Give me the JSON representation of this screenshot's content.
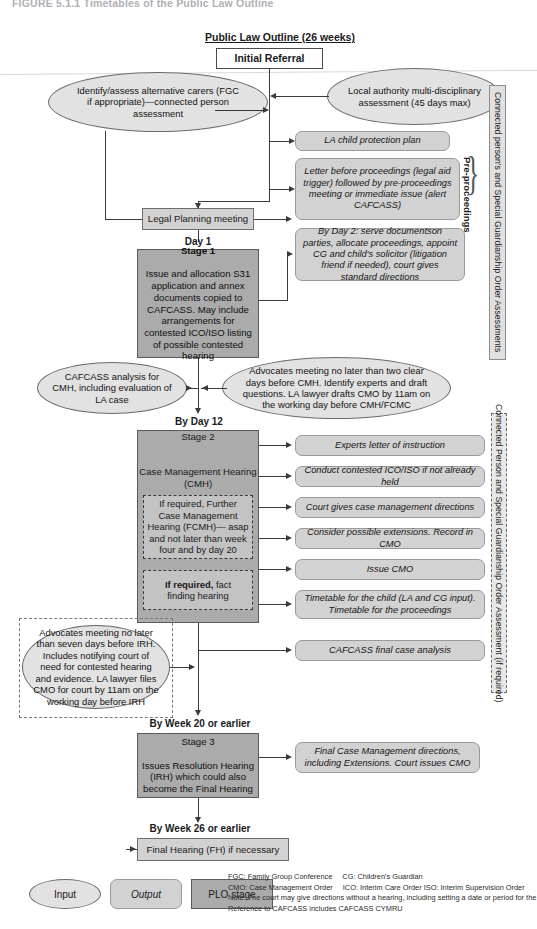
{
  "figure": {
    "caption": "FIGURE 5.1.1   Timetables of the Public Law Outline"
  },
  "header": {
    "plo_title": "Public Law Outline (26 weeks)",
    "initial_referral": "Initial Referral"
  },
  "inputs": {
    "identify_carers": "Identify/assess alternative carers (FGC if appropriate)—connected person assessment",
    "local_authority": "Local authority multi-disciplinary assessment (45 days max)",
    "cafcass_analysis": "CAFCASS analysis for CMH, including evaluation of LA case",
    "advocates_cmh": "Advocates meeting no later than two clear days before CMH. Identify experts and draft questions. LA lawyer drafts CMO by 11am on the working day before CMH/FCMC",
    "advocates_irh": "Advocates meeting no later than seven days before IRH. Includes notifying court of need for contested hearing and evidence. LA lawyer files CMO for court by 11am on the working day before IRH"
  },
  "pre_proceedings": {
    "legal_planning_meeting": "Legal Planning meeting",
    "la_child_protection_plan": "LA child protection plan",
    "letter_before_proceedings": "Letter before proceedings (legal aid trigger) followed by pre-proceedings meeting or immediate issue (alert CAFCASS)",
    "brace_label": "Pre-proceedings"
  },
  "stages": {
    "stage1": {
      "day_label": "Day 1",
      "title": "Stage 1",
      "body": "Issue and allocation S31 application and annex documents copied to CAFCASS. May include arrangements for contested ICO/ISO listing of possible contested hearing",
      "output": "By Day 2: serve documentson parties, allocate proceedings, appoint CG and child's solicitor (litigation friend if needed), court gives standard directions",
      "output_lead_bold": "By Day 2:"
    },
    "stage2": {
      "day_label": "By Day 12",
      "title": "Stage 2",
      "subtitle": "Case Management Hearing (CMH)",
      "dashed_fcmh": "If required, Further Case Management Hearing (FCMH)— asap and not later than week four and by day 20",
      "dashed_fact": "If required, fact finding hearing",
      "dashed_fact_bold": "If required,",
      "outputs": [
        "Experts letter of instruction",
        "Conduct contested ICO/ISO if not already held",
        "Court gives case management directions",
        "Consider possible extensions. Record in CMO",
        "Issue CMO",
        "Timetable for the child (LA and CG input). Timetable for the proceedings",
        "CAFCASS final case analysis"
      ]
    },
    "stage3": {
      "day_label": "By Week 20 or earlier",
      "title": "Stage 3",
      "body": "Issues Resolution Hearing (IRH) which could also become the Final Hearing",
      "output": "Final Case Management directions, including Extensions. Court issues CMO"
    },
    "final": {
      "day_label": "By Week 26 or earlier",
      "box": "Final Hearing (FH) if necessary"
    }
  },
  "sidebars": {
    "upper": "Connected person's and Special Guardianship Order Assessments",
    "lower": "Connected Person and Special Guardianship Order Assessment (if required)"
  },
  "legend": {
    "input": "Input",
    "output": "Output",
    "plo_stage": "PLO stage"
  },
  "footnotes": {
    "line1_a": "FGC: Family Group Conference",
    "line1_b": "CG: Children's Guardian",
    "line2_a": "CMO: Case Management Order",
    "line2_b": "ICO: Interim Care Order ISO: Interim Supervision Order",
    "line3": "Note: The court may give directions without a hearing, including setting a date or period for the FH.",
    "line4": "Reference to CAFCASS includes CAFCASS CYMRU"
  }
}
